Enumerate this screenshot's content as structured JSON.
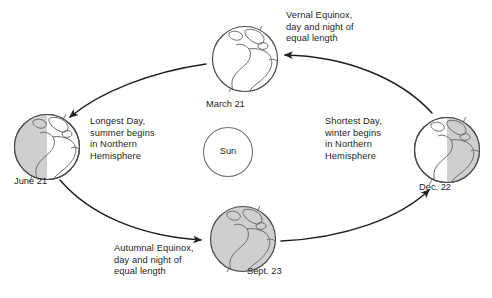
{
  "diagram": {
    "center_body": {
      "name": "Sun",
      "label": "Sun"
    },
    "orbit": {
      "direction": "counterclockwise",
      "shape": "ellipse"
    },
    "colors": {
      "stroke": "#231f20",
      "shadow_fill": "#cfcfcf",
      "lit_fill": "#ffffff",
      "background": "#ffffff",
      "text": "#231f20"
    },
    "positions": [
      {
        "id": "march",
        "date_label": "March 21",
        "caption": "Vernal Equinox,\nday and night of\nequal length",
        "shading": "none",
        "cx": 245,
        "cy": 59,
        "r": 33
      },
      {
        "id": "june",
        "date_label": "June 21",
        "caption": "Longest Day,\nsummer begins\nin Northern\nHemisphere",
        "shading": "left-half",
        "cx": 47,
        "cy": 147,
        "r": 33
      },
      {
        "id": "sept",
        "date_label": "Sept. 23",
        "caption": "Autumnal Equinox,\nday and night of\nequal length",
        "shading": "full",
        "cx": 243,
        "cy": 239,
        "r": 33
      },
      {
        "id": "dec",
        "date_label": "Dec. 22",
        "caption": "Shortest Day,\nwinter begins\nin Northern\nHemisphere",
        "shading": "right-half",
        "cx": 447,
        "cy": 150,
        "r": 33
      }
    ],
    "arrows": [
      {
        "id": "arrow-to-june",
        "from": "march",
        "to": "june",
        "points_to": "June 21"
      },
      {
        "id": "arrow-to-sept",
        "from": "june",
        "to": "sept",
        "points_to": "Sept. 23"
      },
      {
        "id": "arrow-to-dec",
        "from": "sept",
        "to": "dec",
        "points_to": "Dec. 22"
      },
      {
        "id": "arrow-to-march",
        "from": "dec",
        "to": "march",
        "points_to": "March 21"
      }
    ]
  }
}
